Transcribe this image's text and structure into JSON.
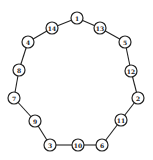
{
  "diagram": {
    "type": "cycle-graph",
    "node_radius": 6,
    "colors": {
      "stroke": "#222222",
      "fill": "#ffffff",
      "background": "#ffffff"
    },
    "nodes": [
      {
        "label": "1",
        "x": 77,
        "y": 18
      },
      {
        "label": "13",
        "x": 100,
        "y": 28
      },
      {
        "label": "5",
        "x": 125,
        "y": 42
      },
      {
        "label": "12",
        "x": 131,
        "y": 71
      },
      {
        "label": "2",
        "x": 138,
        "y": 98
      },
      {
        "label": "11",
        "x": 121,
        "y": 120
      },
      {
        "label": "6",
        "x": 102,
        "y": 145
      },
      {
        "label": "10",
        "x": 78,
        "y": 145
      },
      {
        "label": "3",
        "x": 50,
        "y": 145
      },
      {
        "label": "9",
        "x": 35,
        "y": 121
      },
      {
        "label": "7",
        "x": 14,
        "y": 98
      },
      {
        "label": "8",
        "x": 19,
        "y": 70
      },
      {
        "label": "4",
        "x": 28,
        "y": 42
      },
      {
        "label": "14",
        "x": 52,
        "y": 28
      }
    ],
    "edges": [
      [
        "1",
        "13"
      ],
      [
        "13",
        "5"
      ],
      [
        "5",
        "12"
      ],
      [
        "12",
        "2"
      ],
      [
        "2",
        "11"
      ],
      [
        "11",
        "6"
      ],
      [
        "6",
        "10"
      ],
      [
        "10",
        "3"
      ],
      [
        "3",
        "9"
      ],
      [
        "9",
        "7"
      ],
      [
        "7",
        "8"
      ],
      [
        "8",
        "4"
      ],
      [
        "4",
        "14"
      ],
      [
        "14",
        "1"
      ]
    ]
  }
}
